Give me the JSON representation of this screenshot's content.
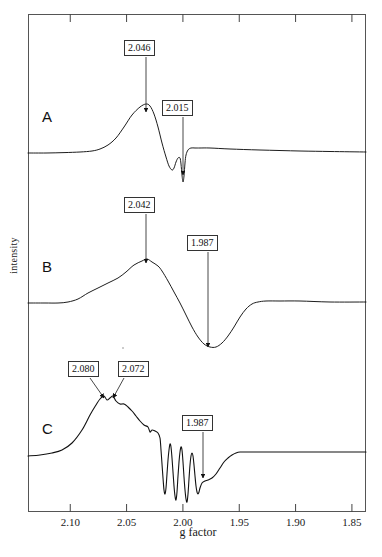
{
  "figure": {
    "type": "epr-spectra",
    "xlabel": "g factor",
    "ylabel": "intensity",
    "frame": {
      "left": 28,
      "right": 366,
      "top": 14,
      "bottom": 512
    },
    "panels": [
      {
        "id": "A",
        "label": "A",
        "label_x": 42,
        "label_y": 108
      },
      {
        "id": "B",
        "label": "B",
        "label_x": 42,
        "label_y": 258
      },
      {
        "id": "C",
        "label": "C",
        "label_x": 42,
        "label_y": 420
      }
    ],
    "annotations": [
      {
        "text": "2.046",
        "panel": "A",
        "box_x": 124,
        "box_y": 40,
        "arrow_x": 146,
        "arrow_y0": 57,
        "arrow_y1": 112
      },
      {
        "text": "2.015",
        "panel": "A",
        "box_x": 162,
        "box_y": 100,
        "arrow_x": 183,
        "arrow_y0": 117,
        "arrow_y1": 175
      },
      {
        "text": "2.042",
        "panel": "B",
        "box_x": 124,
        "box_y": 197,
        "arrow_x": 146,
        "arrow_y0": 214,
        "arrow_y1": 263
      },
      {
        "text": "1.987",
        "panel": "B",
        "box_x": 187,
        "box_y": 235,
        "arrow_x": 208,
        "arrow_y0": 252,
        "arrow_y1": 347
      },
      {
        "text": "2.080",
        "panel": "C",
        "box_x": 68,
        "box_y": 361,
        "arrow_x0": 90,
        "arrow_y0": 378,
        "arrow_x1": 104,
        "arrow_y1": 398
      },
      {
        "text": "2.072",
        "panel": "C",
        "box_x": 118,
        "box_y": 361,
        "arrow_x0": 124,
        "arrow_y0": 378,
        "arrow_x1": 113,
        "arrow_y1": 398
      },
      {
        "text": "1.987",
        "panel": "C",
        "box_x": 182,
        "box_y": 415,
        "arrow_x": 203,
        "arrow_y0": 432,
        "arrow_y1": 478
      }
    ]
  },
  "chart_data": {
    "type": "line",
    "title": "",
    "xlabel": "g factor",
    "ylabel": "intensity",
    "xlim": [
      2.1375,
      1.8375
    ],
    "x_inverted": true,
    "grid": false,
    "legend": "none",
    "xticks": [
      2.1,
      2.05,
      2.0,
      1.95,
      1.9,
      1.85
    ],
    "xticklabels": [
      "2.10",
      "2.05",
      "2.00",
      "1.95",
      "1.90",
      "1.85"
    ],
    "yticks": [],
    "yticklabels": [],
    "series": [
      {
        "name": "A",
        "annotated_g_values": [
          2.046,
          2.015
        ],
        "description": "Sharp derivative EPR signal: positive peak at g=2.046, small negative lobe near g=2.025, deep narrow negative spike at g=2.015, flat baseline elsewhere.",
        "baseline_y": 153,
        "points": [
          [
            28,
            153
          ],
          [
            46,
            153
          ],
          [
            64,
            152.6
          ],
          [
            80,
            152
          ],
          [
            92,
            151
          ],
          [
            100,
            149
          ],
          [
            108,
            145
          ],
          [
            116,
            138
          ],
          [
            124,
            127
          ],
          [
            132,
            115
          ],
          [
            140,
            107
          ],
          [
            146,
            104
          ],
          [
            150,
            106
          ],
          [
            154,
            114
          ],
          [
            158,
            127
          ],
          [
            162,
            143
          ],
          [
            166,
            157
          ],
          [
            169,
            166
          ],
          [
            172,
            170
          ],
          [
            174,
            168
          ],
          [
            176,
            162
          ],
          [
            178,
            158
          ],
          [
            180,
            158
          ],
          [
            181,
            164
          ],
          [
            182,
            175
          ],
          [
            183,
            182
          ],
          [
            184,
            176
          ],
          [
            185,
            163
          ],
          [
            186,
            155
          ],
          [
            188,
            150
          ],
          [
            191,
            148
          ],
          [
            195,
            148
          ],
          [
            200,
            148
          ],
          [
            210,
            148
          ],
          [
            230,
            149
          ],
          [
            260,
            150
          ],
          [
            300,
            151
          ],
          [
            330,
            151.5
          ],
          [
            366,
            152
          ]
        ]
      },
      {
        "name": "B",
        "annotated_g_values": [
          2.042,
          1.987
        ],
        "description": "Broad derivative signal: broad positive maximum at g=2.042 with a shoulder near g=2.065, broad negative minimum at g=1.987, returns to baseline.",
        "baseline_y": 303,
        "points": [
          [
            28,
            303
          ],
          [
            45,
            303
          ],
          [
            58,
            303
          ],
          [
            68,
            302
          ],
          [
            78,
            299
          ],
          [
            88,
            293
          ],
          [
            98,
            288
          ],
          [
            108,
            283
          ],
          [
            118,
            278
          ],
          [
            126,
            272
          ],
          [
            134,
            265
          ],
          [
            142,
            261
          ],
          [
            147,
            259
          ],
          [
            152,
            262
          ],
          [
            158,
            266
          ],
          [
            162,
            271
          ],
          [
            168,
            281
          ],
          [
            174,
            292
          ],
          [
            180,
            303
          ],
          [
            186,
            315
          ],
          [
            192,
            327
          ],
          [
            198,
            337
          ],
          [
            204,
            344
          ],
          [
            210,
            347
          ],
          [
            216,
            347
          ],
          [
            222,
            343
          ],
          [
            228,
            336
          ],
          [
            234,
            327
          ],
          [
            240,
            317
          ],
          [
            246,
            309
          ],
          [
            252,
            304
          ],
          [
            258,
            302
          ],
          [
            266,
            301
          ],
          [
            280,
            301
          ],
          [
            300,
            301
          ],
          [
            330,
            302
          ],
          [
            366,
            302
          ]
        ]
      },
      {
        "name": "C",
        "annotated_g_values": [
          2.08,
          2.072,
          1.987
        ],
        "description": "Noisy spectrum with two resolved maxima at g=2.080 and g=2.072, descending shoulder, four sharp hyperfine-like negative oscillations between g~2.015 and g~1.99, broad minimum at g=1.987, then flat noisy baseline.",
        "baseline_y": 454,
        "hyperfine_count": 4,
        "points": [
          [
            28,
            456
          ],
          [
            40,
            455
          ],
          [
            52,
            453
          ],
          [
            62,
            450
          ],
          [
            72,
            443
          ],
          [
            82,
            430
          ],
          [
            90,
            415
          ],
          [
            96,
            405
          ],
          [
            100,
            399
          ],
          [
            104,
            396
          ],
          [
            107,
            400
          ],
          [
            110,
            398
          ],
          [
            113,
            396
          ],
          [
            116,
            401
          ],
          [
            120,
            404
          ],
          [
            124,
            404
          ],
          [
            128,
            407
          ],
          [
            132,
            411
          ],
          [
            136,
            416
          ],
          [
            140,
            421
          ],
          [
            144,
            425
          ],
          [
            148,
            427
          ],
          [
            150,
            432
          ],
          [
            152,
            430
          ],
          [
            155,
            431
          ],
          [
            158,
            433
          ],
          [
            160,
            438
          ],
          [
            161,
            450
          ],
          [
            162,
            464
          ],
          [
            163,
            478
          ],
          [
            164,
            490
          ],
          [
            165,
            494
          ],
          [
            166,
            488
          ],
          [
            167,
            474
          ],
          [
            168,
            460
          ],
          [
            169,
            450
          ],
          [
            170,
            444
          ],
          [
            171,
            447
          ],
          [
            172,
            458
          ],
          [
            173,
            472
          ],
          [
            174,
            486
          ],
          [
            175,
            496
          ],
          [
            176,
            500
          ],
          [
            177,
            492
          ],
          [
            178,
            476
          ],
          [
            179,
            462
          ],
          [
            180,
            452
          ],
          [
            181,
            447
          ],
          [
            182,
            450
          ],
          [
            183,
            462
          ],
          [
            184,
            477
          ],
          [
            185,
            490
          ],
          [
            186,
            499
          ],
          [
            187,
            502
          ],
          [
            188,
            494
          ],
          [
            189,
            479
          ],
          [
            190,
            465
          ],
          [
            191,
            456
          ],
          [
            192,
            453
          ],
          [
            193,
            456
          ],
          [
            194,
            465
          ],
          [
            195,
            476
          ],
          [
            196,
            486
          ],
          [
            197,
            492
          ],
          [
            198,
            494
          ],
          [
            199,
            492
          ],
          [
            200,
            488
          ],
          [
            202,
            483
          ],
          [
            205,
            481
          ],
          [
            208,
            480
          ],
          [
            212,
            478
          ],
          [
            216,
            474
          ],
          [
            220,
            468
          ],
          [
            224,
            462
          ],
          [
            228,
            458
          ],
          [
            232,
            455
          ],
          [
            236,
            453
          ],
          [
            240,
            452
          ],
          [
            246,
            452
          ],
          [
            256,
            452
          ],
          [
            270,
            452
          ],
          [
            290,
            452
          ],
          [
            320,
            452
          ],
          [
            366,
            452
          ]
        ]
      }
    ]
  }
}
